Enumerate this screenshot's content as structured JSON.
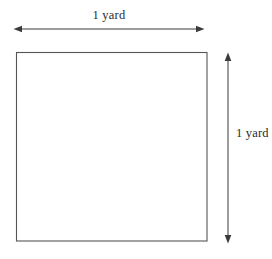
{
  "figure": {
    "type": "geometry-diagram",
    "background_color": "#ffffff",
    "stroke_color": "#555555",
    "text_color": "#2b2b2b",
    "shape": {
      "name": "square",
      "fill": "none",
      "x": 16,
      "y": 52,
      "width": 191,
      "height": 189
    },
    "dimensions": {
      "width_label": "1 yard",
      "height_label": "1 yard"
    },
    "annotations": [
      {
        "name": "width-dimension-arrow",
        "orientation": "horizontal",
        "label": "1 yard",
        "from": 15,
        "to": 203,
        "axis_position": 29,
        "arrowheads": "both"
      },
      {
        "name": "height-dimension-arrow",
        "orientation": "vertical",
        "label": "1 yard",
        "from": 53,
        "to": 243,
        "axis_position": 228,
        "arrowheads": "both"
      }
    ]
  }
}
